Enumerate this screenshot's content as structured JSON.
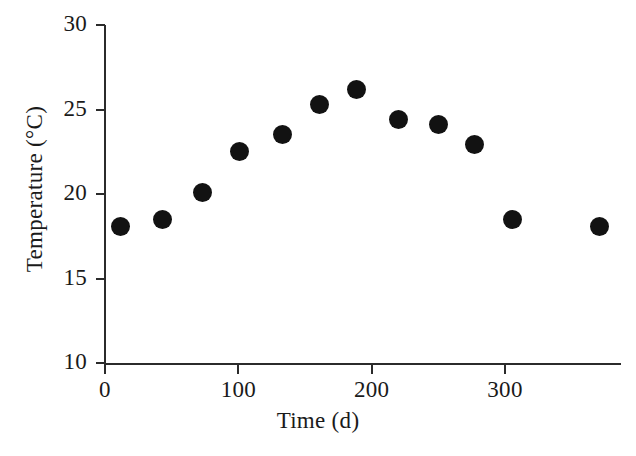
{
  "chart_data": {
    "type": "scatter",
    "title": "",
    "xlabel": "Time (d)",
    "ylabel": "Temperature (°C)",
    "xlim": [
      0,
      387
    ],
    "ylim": [
      10,
      30
    ],
    "xticks": [
      0,
      100,
      200,
      300
    ],
    "yticks": [
      10,
      15,
      20,
      25,
      30
    ],
    "xticklabels": [
      "0",
      "100",
      "200",
      "300"
    ],
    "yticklabels": [
      "10",
      "15",
      "20",
      "25",
      "30"
    ],
    "grid": false,
    "legend": null,
    "marker": "filled-circle",
    "marker_color": "#121212",
    "x": [
      12,
      43,
      73,
      101,
      133,
      161,
      189,
      220,
      250,
      277,
      306,
      371
    ],
    "y": [
      18.1,
      18.5,
      20.1,
      22.5,
      23.5,
      25.3,
      26.2,
      24.4,
      24.1,
      22.9,
      18.5,
      18.1
    ],
    "points": [
      {
        "x": 12,
        "y": 18.1
      },
      {
        "x": 43,
        "y": 18.5
      },
      {
        "x": 73,
        "y": 20.1
      },
      {
        "x": 101,
        "y": 22.5
      },
      {
        "x": 133,
        "y": 23.5
      },
      {
        "x": 161,
        "y": 25.3
      },
      {
        "x": 189,
        "y": 26.2
      },
      {
        "x": 220,
        "y": 24.4
      },
      {
        "x": 250,
        "y": 24.1
      },
      {
        "x": 277,
        "y": 22.9
      },
      {
        "x": 306,
        "y": 18.5
      },
      {
        "x": 371,
        "y": 18.1
      }
    ]
  },
  "axes": {
    "x_title": "Time (d)",
    "y_title": "Temperature (°C)",
    "axis_color": "#2b2b2b",
    "background": "#ffffff"
  }
}
